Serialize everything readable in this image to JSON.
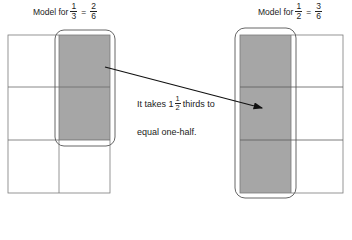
{
  "left_model": {
    "title_prefix": "Model for",
    "lhs": {
      "numerator": "1",
      "denominator": "3"
    },
    "equals": "=",
    "rhs": {
      "numerator": "2",
      "denominator": "6"
    },
    "grid": {
      "columns": 2,
      "rows": 3,
      "shaded_cells": [
        [
          0,
          1
        ],
        [
          1,
          1
        ]
      ]
    }
  },
  "right_model": {
    "title_prefix": "Model for",
    "lhs": {
      "numerator": "1",
      "denominator": "2"
    },
    "equals": "=",
    "rhs": {
      "numerator": "3",
      "denominator": "6"
    },
    "grid": {
      "columns": 2,
      "rows": 3,
      "shaded_cells": [
        [
          0,
          0
        ],
        [
          1,
          0
        ],
        [
          2,
          0
        ]
      ]
    }
  },
  "caption": {
    "line1_prefix": "It takes 1",
    "mixed_frac": {
      "numerator": "1",
      "denominator": "2"
    },
    "line1_suffix": "thirds to",
    "line2": "equal one-half."
  },
  "colors": {
    "shade": "#a6a6a6",
    "grid_line": "#7a7a7a",
    "outline": "#555555",
    "arrow": "#111111"
  }
}
